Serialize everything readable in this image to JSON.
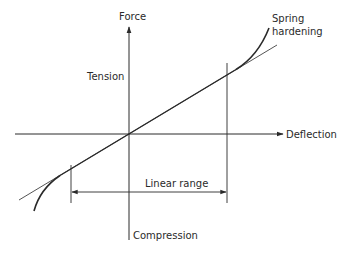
{
  "diagram": {
    "type": "force-deflection",
    "labels": {
      "y_axis": "Force",
      "x_axis": "Deflection",
      "positive_region": "Tension",
      "negative_region": "Compression",
      "nonlinear_line1": "Spring",
      "nonlinear_line2": "hardening",
      "range": "Linear range"
    },
    "colors": {
      "ink": "#2a2a2a",
      "background": "#ffffff"
    }
  }
}
